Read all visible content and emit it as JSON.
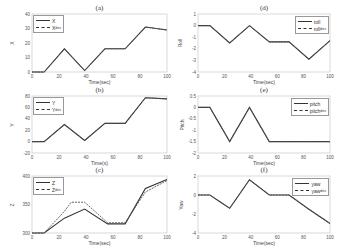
{
  "chart_data": [
    {
      "id": "a",
      "type": "line",
      "title": "(a)",
      "xlabel": "Time(sec)",
      "ylabel": "X",
      "xlim": [
        0,
        100
      ],
      "ylim": [
        0,
        40
      ],
      "xticks": [
        0,
        20,
        40,
        60,
        80,
        100
      ],
      "yticks": [
        0,
        10,
        20,
        30,
        40
      ],
      "legend": {
        "position": "upper-left",
        "entries": [
          "X",
          "X_des"
        ]
      },
      "series": [
        {
          "name": "X",
          "style": "solid",
          "x": [
            0,
            9,
            24,
            39,
            54,
            69,
            84,
            100
          ],
          "y": [
            0,
            0,
            16,
            1,
            16,
            16,
            31,
            29
          ]
        },
        {
          "name": "X_des",
          "style": "dashed",
          "x": [
            0,
            9,
            24,
            39,
            54,
            69,
            84,
            100
          ],
          "y": [
            0,
            0,
            16,
            1,
            16,
            16,
            31,
            29
          ]
        }
      ]
    },
    {
      "id": "b",
      "type": "line",
      "title": "(b)",
      "xlabel": "Time(s)",
      "ylabel": "Y",
      "xlim": [
        0,
        100
      ],
      "ylim": [
        -20,
        80
      ],
      "xticks": [
        0,
        20,
        40,
        60,
        80,
        100
      ],
      "yticks": [
        -20,
        0,
        20,
        40,
        60,
        80
      ],
      "legend": {
        "position": "upper-left",
        "entries": [
          "Y",
          "Y_des"
        ]
      },
      "series": [
        {
          "name": "Y",
          "style": "solid",
          "x": [
            0,
            9,
            24,
            39,
            54,
            69,
            84,
            100
          ],
          "y": [
            0,
            0,
            30,
            2,
            32,
            32,
            77,
            75
          ]
        },
        {
          "name": "Y_des",
          "style": "dashed",
          "x": [
            0,
            9,
            24,
            39,
            54,
            69,
            84,
            100
          ],
          "y": [
            0,
            0,
            30,
            2,
            32,
            32,
            77,
            75
          ]
        }
      ]
    },
    {
      "id": "c",
      "type": "line",
      "title": "(c)",
      "xlabel": "Time(sec)",
      "ylabel": "Z",
      "xlim": [
        0,
        100
      ],
      "ylim": [
        300,
        400
      ],
      "xticks": [
        0,
        20,
        40,
        60,
        80,
        100
      ],
      "yticks": [
        300,
        350,
        400
      ],
      "legend": {
        "position": "upper-left",
        "entries": [
          "Z",
          "Z_des"
        ]
      },
      "series": [
        {
          "name": "Z",
          "style": "solid",
          "x": [
            0,
            9,
            24,
            39,
            56,
            69,
            84,
            100
          ],
          "y": [
            300,
            300,
            326,
            342,
            316,
            316,
            378,
            394
          ]
        },
        {
          "name": "Z_des",
          "style": "dashed",
          "x": [
            0,
            9,
            24,
            29,
            39,
            56,
            69,
            84,
            100
          ],
          "y": [
            300,
            300,
            338,
            354,
            354,
            318,
            318,
            372,
            392
          ]
        }
      ]
    },
    {
      "id": "d",
      "type": "line",
      "title": "(d)",
      "xlabel": "Time(sec)",
      "ylabel": "Roll",
      "xlim": [
        0,
        100
      ],
      "ylim": [
        -4,
        1
      ],
      "xticks": [
        0,
        20,
        40,
        60,
        80,
        100
      ],
      "yticks": [
        -4,
        -3,
        -2,
        -1,
        0,
        1
      ],
      "legend": {
        "position": "upper-right",
        "entries": [
          "roll",
          "roll_des"
        ]
      },
      "series": [
        {
          "name": "roll",
          "style": "solid",
          "x": [
            0,
            9,
            24,
            39,
            54,
            69,
            84,
            100
          ],
          "y": [
            0,
            0,
            -1.5,
            0,
            -1.4,
            -1.4,
            -2.9,
            -1.3
          ]
        },
        {
          "name": "roll_des",
          "style": "dashed",
          "x": [
            0,
            9,
            24,
            39,
            54,
            69,
            84,
            100
          ],
          "y": [
            0,
            0,
            -1.5,
            0,
            -1.4,
            -1.4,
            -2.9,
            -1.3
          ]
        }
      ]
    },
    {
      "id": "e",
      "type": "line",
      "title": "(e)",
      "xlabel": "Time(sec)",
      "ylabel": "Pitch",
      "xlim": [
        0,
        100
      ],
      "ylim": [
        -2,
        0.5
      ],
      "xticks": [
        0,
        20,
        40,
        60,
        80,
        100
      ],
      "yticks": [
        -2,
        -1.5,
        -1,
        -0.5,
        0,
        0.5
      ],
      "legend": {
        "position": "upper-right",
        "entries": [
          "pitch",
          "pitch_des"
        ]
      },
      "series": [
        {
          "name": "pitch",
          "style": "solid",
          "x": [
            0,
            9,
            24,
            39,
            54,
            69,
            84,
            100
          ],
          "y": [
            0,
            0,
            -1.5,
            0,
            -1.5,
            -1.5,
            -1.5,
            -1.5
          ]
        },
        {
          "name": "pitch_des",
          "style": "dashed",
          "x": [
            0,
            9,
            24,
            39,
            54,
            69,
            84,
            100
          ],
          "y": [
            0,
            0,
            -1.5,
            0,
            -1.5,
            -1.5,
            -1.5,
            -1.5
          ]
        }
      ]
    },
    {
      "id": "f",
      "type": "line",
      "title": "(f)",
      "xlabel": "Time(sec)",
      "ylabel": "Yaw",
      "xlim": [
        0,
        100
      ],
      "ylim": [
        -4,
        2
      ],
      "xticks": [
        0,
        20,
        40,
        60,
        80,
        100
      ],
      "yticks": [
        -4,
        -2,
        0,
        2
      ],
      "legend": {
        "position": "upper-right",
        "entries": [
          "yaw",
          "yaw_des"
        ]
      },
      "series": [
        {
          "name": "yaw",
          "style": "solid",
          "x": [
            0,
            9,
            24,
            39,
            54,
            69,
            84,
            100
          ],
          "y": [
            0,
            0,
            -1.4,
            1.6,
            0,
            0,
            -1.5,
            -3
          ]
        },
        {
          "name": "yaw_des",
          "style": "dashed",
          "x": [
            0,
            9,
            24,
            39,
            54,
            69,
            84,
            100
          ],
          "y": [
            0,
            0,
            -1.4,
            1.6,
            0,
            0,
            -1.5,
            -3
          ]
        }
      ]
    }
  ],
  "panels": {
    "a": {
      "title": "(a)",
      "xlabel": "Time(sec)",
      "ylabel": "X",
      "leg1": "X",
      "leg2": "X",
      "leg2sub": "des"
    },
    "b": {
      "title": "(b)",
      "xlabel": "Time(s)",
      "ylabel": "Y",
      "leg1": "Y",
      "leg2": "Y",
      "leg2sub": "des"
    },
    "c": {
      "title": "(c)",
      "xlabel": "Time(sec)",
      "ylabel": "Z",
      "leg1": "Z",
      "leg2": "Z",
      "leg2sub": "des"
    },
    "d": {
      "title": "(d)",
      "xlabel": "Time(sec)",
      "ylabel": "Roll",
      "leg1": "roll",
      "leg2": "roll",
      "leg2sub": "des"
    },
    "e": {
      "title": "(e)",
      "xlabel": "Time(sec)",
      "ylabel": "Pitch",
      "leg1": "pitch",
      "leg2": "pitch",
      "leg2sub": "des"
    },
    "f": {
      "title": "(f)",
      "xlabel": "Time(sec)",
      "ylabel": "Yaw",
      "leg1": "yaw",
      "leg2": "yaw",
      "leg2sub": "des"
    }
  }
}
